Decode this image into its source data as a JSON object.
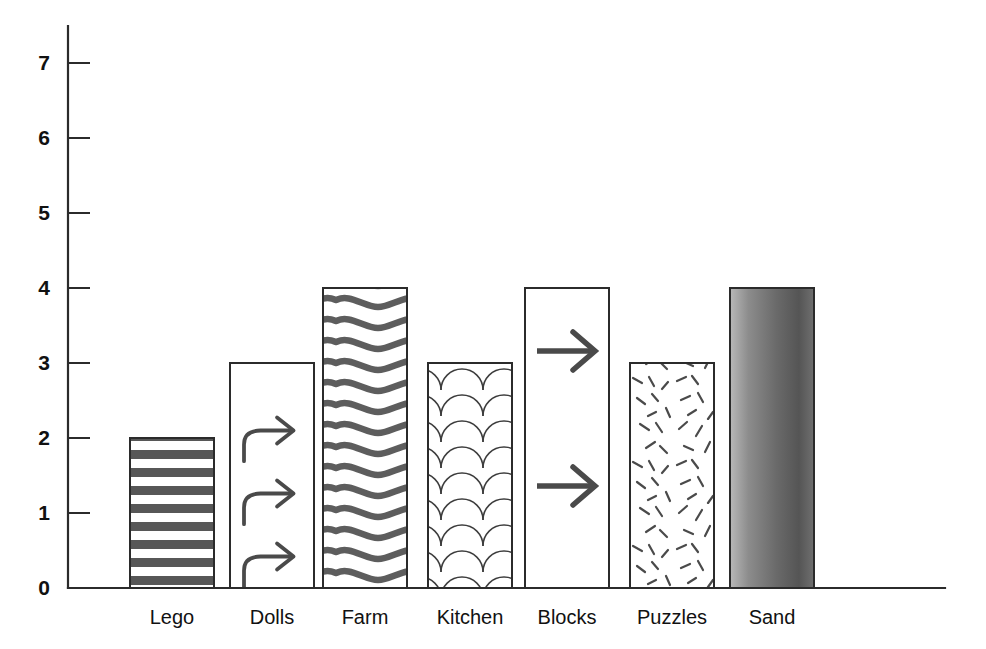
{
  "chart_data": {
    "type": "bar",
    "title": "",
    "subtitle": "",
    "xlabel": "",
    "ylabel": "",
    "categories": [
      "Lego",
      "Dolls",
      "Farm",
      "Kitchen",
      "Blocks",
      "Puzzles",
      "Sand"
    ],
    "values": [
      2,
      3,
      4,
      3,
      4,
      3,
      4
    ],
    "ylim": [
      0,
      7
    ],
    "ytick_labels": [
      "0",
      "1",
      "2",
      "3",
      "4",
      "5",
      "6",
      "7"
    ],
    "ytick_values": [
      0,
      1,
      2,
      3,
      4,
      5,
      6,
      7
    ],
    "grid": false,
    "legend": null,
    "series": [
      {
        "name": "Count",
        "values": [
          2,
          3,
          4,
          3,
          4,
          3,
          4
        ]
      }
    ],
    "bar_fills": [
      "horizontal-stripes",
      "curved-arrows",
      "wavy-lines",
      "fish-scales",
      "straight-arrows",
      "random-dashes",
      "gray-gradient"
    ],
    "annotations": []
  },
  "colors": {
    "axis": "#2b2b2b",
    "outline": "#2b2b2b",
    "pattern_dark": "#555555",
    "pattern_mid": "#666666",
    "pattern_light": "#ffffff",
    "text": "#111111",
    "background": "#ffffff",
    "sand_light": "#b4b4b4",
    "sand_dark": "#4f4f4f"
  },
  "geometry": {
    "baseline_y": 588,
    "unit_px": 75,
    "axis_x": 68,
    "axis_top_y": 26,
    "axis_right_x": 945,
    "bar_width": 84,
    "bar_lefts": [
      130,
      230,
      323,
      428,
      525,
      630,
      730
    ]
  }
}
